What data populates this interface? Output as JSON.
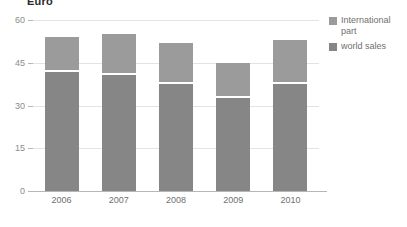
{
  "chart_data": {
    "type": "bar",
    "subtype": "stacked-bar",
    "title": "Euro",
    "xlabel": "",
    "ylabel": "",
    "categories": [
      "2006",
      "2007",
      "2008",
      "2009",
      "2010"
    ],
    "series": [
      {
        "name": "world sales",
        "color": "#868686",
        "values": [
          42,
          41,
          38,
          33,
          38
        ]
      },
      {
        "name": "International part",
        "color": "#9b9b9b",
        "values": [
          12,
          14,
          14,
          12,
          15
        ]
      }
    ],
    "totals": [
      54,
      55,
      52,
      45,
      53
    ],
    "ylim": [
      0,
      60
    ],
    "yticks": [
      0,
      15,
      30,
      45,
      60
    ],
    "ytick_labels": [
      "0",
      "15",
      "30",
      "45",
      "60"
    ],
    "grid": true,
    "grid_color": "#e3e3e3",
    "legend_position": "right",
    "legend": [
      {
        "label": "International part",
        "color": "#9b9b9b"
      },
      {
        "label": "world sales",
        "color": "#868686"
      }
    ],
    "axis_color": "#b6b6b6",
    "background": "#ffffff"
  }
}
